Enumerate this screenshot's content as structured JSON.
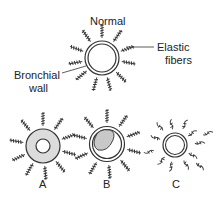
{
  "figure": {
    "title": "Normal",
    "labels": {
      "elastic_fibers_line1": "Elastic",
      "elastic_fibers_line2": "fibers",
      "bronchial_wall_line1": "Bronchial",
      "bronchial_wall_line2": "wall"
    },
    "panels": [
      {
        "id": "normal",
        "label": "Normal"
      },
      {
        "id": "A",
        "label": "A"
      },
      {
        "id": "B",
        "label": "B"
      },
      {
        "id": "C",
        "label": "C"
      }
    ],
    "colors": {
      "stroke": "#333333",
      "fill_gray": "#dcdcdc",
      "blob_gray": "#c8c8c8"
    }
  }
}
